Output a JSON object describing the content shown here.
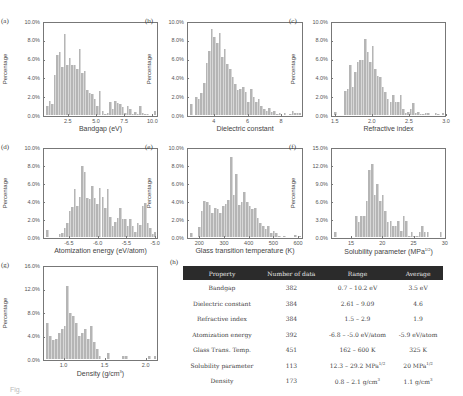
{
  "chart_data": [
    {
      "panel": "(a)",
      "type": "bar",
      "xlabel": "Bandgap (eV)",
      "ylabel": "Percentage",
      "ylim": [
        0,
        10
      ],
      "yticks": [
        "0.0%",
        "2.0%",
        "4.0%",
        "6.0%",
        "8.0%",
        "10.0%"
      ],
      "xlim": [
        0.3,
        10.5
      ],
      "xticks": [
        "2.5",
        "5.0",
        "7.5",
        "10.0"
      ],
      "xtick_values": [
        2.5,
        5.0,
        7.5,
        10.0
      ],
      "values": [
        1.0,
        1.5,
        1.2,
        4.4,
        6.5,
        6.9,
        5.2,
        8.8,
        5.4,
        6.2,
        5.4,
        5.4,
        5.0,
        7.2,
        4.6,
        4.8,
        2.7,
        2.4,
        2.3,
        1.7,
        1.0,
        2.6,
        0.4,
        0.1,
        0.2,
        1.4,
        0.6,
        1.5,
        1.3,
        1.2,
        0.9,
        0.2,
        1.0,
        0.6,
        0.1,
        0.3,
        0.1,
        1.0,
        0.2,
        0.1,
        0.1,
        0.0,
        0.0,
        0.4
      ]
    },
    {
      "panel": "(b)",
      "type": "bar",
      "xlabel": "Dielectric constant",
      "ylabel": "Percentage",
      "ylim": [
        0,
        10
      ],
      "yticks": [
        "0.0%",
        "2.0%",
        "4.0%",
        "6.0%",
        "8.0%",
        "10.0%"
      ],
      "xlim": [
        2.4,
        9.3
      ],
      "xticks": [
        "4",
        "6",
        "8"
      ],
      "xtick_values": [
        4,
        6,
        8
      ],
      "values": [
        1.2,
        0.0,
        2.0,
        1.7,
        2.4,
        3.5,
        5.6,
        7.0,
        9.3,
        8.5,
        7.8,
        8.9,
        6.3,
        7.2,
        5.5,
        5.0,
        4.1,
        3.4,
        2.7,
        2.8,
        3.0,
        2.5,
        1.4,
        2.8,
        2.0,
        1.4,
        1.7,
        1.0,
        0.7,
        0.4,
        0.8,
        0.3,
        0.4,
        0.1,
        0.2,
        0.0,
        0.2,
        0.0,
        0.1,
        0.4,
        0.2,
        0.2,
        0.2
      ]
    },
    {
      "panel": "(c)",
      "type": "bar",
      "xlabel": "Refractive index",
      "ylabel": "Percentage",
      "ylim": [
        0,
        10
      ],
      "yticks": [
        "0.0%",
        "2.0%",
        "4.0%",
        "6.0%",
        "8.0%",
        "10.0%"
      ],
      "xlim": [
        1.45,
        3.0
      ],
      "xticks": [
        "1.5",
        "2.0",
        "2.5",
        "3.0"
      ],
      "xtick_values": [
        1.5,
        2.0,
        2.5,
        3.0
      ],
      "values": [
        0.3,
        0.0,
        0.0,
        0.0,
        2.6,
        2.8,
        5.4,
        3.0,
        4.7,
        5.8,
        6.0,
        6.0,
        8.3,
        6.8,
        5.8,
        7.5,
        5.0,
        4.2,
        4.1,
        3.0,
        2.5,
        1.7,
        1.4,
        2.2,
        1.4,
        1.4,
        2.2,
        0.7,
        0.2,
        0.3,
        0.7,
        1.3,
        0.2,
        0.3,
        0.1,
        0.1,
        0.2,
        0.2,
        0.0,
        0.0,
        0.2,
        0.1,
        0.0,
        0.2
      ]
    },
    {
      "panel": "(d)",
      "type": "bar",
      "xlabel": "Atomization energy (eV/atom)",
      "ylabel": "Percentage",
      "ylim": [
        0,
        10
      ],
      "yticks": [
        "0.0%",
        "2.0%",
        "4.0%",
        "6.0%",
        "8.0%",
        "10.0%"
      ],
      "xlim": [
        -6.95,
        -4.95
      ],
      "xticks": [
        "-6.5",
        "-6.0",
        "-5.5",
        "-5.0"
      ],
      "xtick_values": [
        -6.5,
        -6.0,
        -5.5,
        -5.0
      ],
      "values": [
        0.8,
        0.0,
        0.0,
        0.0,
        0.0,
        0.3,
        0.4,
        1.0,
        1.6,
        3.0,
        3.4,
        5.5,
        3.5,
        4.5,
        8.1,
        7.4,
        4.4,
        4.3,
        5.8,
        4.4,
        3.8,
        5.6,
        4.6,
        3.3,
        5.4,
        2.3,
        1.3,
        1.7,
        2.2,
        3.3,
        2.0,
        2.0,
        1.3,
        2.0,
        1.2,
        0.6,
        1.6,
        1.4,
        3.5,
        3.9,
        1.6,
        1.0,
        0.3,
        0.6
      ]
    },
    {
      "panel": "(e)",
      "type": "bar",
      "xlabel": "Glass transition temperature (K)",
      "ylabel": "Percentage",
      "ylim": [
        0,
        10
      ],
      "yticks": [
        "0.0%",
        "2.0%",
        "4.0%",
        "6.0%",
        "8.0%",
        "10.0%"
      ],
      "xlim": [
        150,
        620
      ],
      "xticks": [
        "200",
        "300",
        "400",
        "500",
        "600"
      ],
      "xtick_values": [
        200,
        300,
        400,
        500,
        600
      ],
      "values": [
        0.5,
        0.0,
        0.0,
        1.1,
        3.0,
        4.1,
        4.0,
        3.6,
        2.7,
        3.3,
        3.2,
        2.7,
        3.5,
        3.8,
        4.2,
        9.1,
        4.8,
        7.2,
        3.6,
        4.0,
        5.1,
        4.0,
        3.5,
        3.2,
        3.3,
        2.2,
        1.6,
        1.2,
        0.9,
        1.3,
        0.4,
        0.7,
        0.5,
        0.1,
        0.0,
        0.1,
        0.0,
        0.0,
        0.0,
        0.2,
        0.0,
        0.1
      ]
    },
    {
      "panel": "(f)",
      "type": "bar",
      "xlabel": "Solubility parameter (MPa^1/2)",
      "ylabel": "Percentage",
      "ylim": [
        0,
        15
      ],
      "yticks": [
        "0.0%",
        "3.0%",
        "6.0%",
        "9.0%",
        "12.0%",
        "15.0%"
      ],
      "xlim": [
        11.8,
        30.2
      ],
      "xticks": [
        "15",
        "20",
        "25",
        "30"
      ],
      "xtick_values": [
        15,
        20,
        25,
        30
      ],
      "values": [
        0.9,
        0.0,
        0.0,
        0.0,
        0.0,
        0.0,
        0.0,
        0.0,
        3.5,
        2.5,
        3.5,
        3.5,
        6.2,
        11.5,
        12.4,
        7.1,
        9.1,
        6.2,
        7.1,
        4.4,
        2.6,
        2.7,
        1.8,
        1.8,
        2.7,
        1.0,
        3.5,
        2.7,
        0.1,
        0.9,
        0.1,
        0.1,
        0.9,
        1.8,
        0.9,
        0.9,
        0.0,
        0.0,
        0.0,
        0.0,
        0.9,
        0.0
      ]
    },
    {
      "panel": "(g)",
      "type": "bar",
      "xlabel": "Density (g/cm^3)",
      "ylabel": "Percentage",
      "ylim": [
        0,
        16
      ],
      "yticks": [
        "0.0%",
        "4.0%",
        "8.0%",
        "12.0%",
        "16.0%"
      ],
      "xlim": [
        0.75,
        2.15
      ],
      "xticks": [
        "1.0",
        "1.5",
        "2.0"
      ],
      "xtick_values": [
        1.0,
        1.5,
        2.0
      ],
      "values": [
        6.3,
        4.0,
        3.3,
        3.4,
        4.6,
        5.2,
        5.8,
        12.7,
        8.0,
        7.4,
        6.3,
        4.0,
        4.6,
        5.2,
        3.4,
        5.8,
        2.9,
        1.7,
        0.6,
        0.0,
        0.0,
        1.1,
        0.0,
        0.0,
        0.0,
        0.0,
        0.6,
        0.6,
        0.0,
        0.0,
        0.0,
        0.0,
        0.0,
        0.0,
        0.0,
        0.6,
        0.0,
        0.6
      ]
    }
  ],
  "panels": {
    "a": {
      "letter": "(a)",
      "xlabel": "Bandgap (eV)",
      "ylabel": "Percentage"
    },
    "b": {
      "letter": "(b)",
      "xlabel": "Dielectric constant",
      "ylabel": "Percentage"
    },
    "c": {
      "letter": "(c)",
      "xlabel": "Refractive index",
      "ylabel": "Percentage"
    },
    "d": {
      "letter": "(d)",
      "xlabel": "Atomization energy (eV/atom)",
      "ylabel": "Percentage"
    },
    "e": {
      "letter": "(e)",
      "xlabel": "Glass transition temperature (K)",
      "ylabel": "Percentage"
    },
    "f": {
      "letter": "(f)",
      "xlabel_main": "Solubility parameter (MPa",
      "xlabel_sup": "1/2",
      "xlabel_end": ")",
      "ylabel": "Percentage"
    },
    "g": {
      "letter": "(g)",
      "xlabel_main": "Density (g/cm",
      "xlabel_sup": "3",
      "xlabel_end": ")",
      "ylabel": "Percentage"
    },
    "h": {
      "letter": "(h)"
    }
  },
  "table": {
    "headers": [
      "Property",
      "Number of data",
      "Range",
      "Average"
    ],
    "rows": [
      {
        "property": "Bandgap",
        "count": "382",
        "range": "0.7 – 10.2 eV",
        "range_sup": "",
        "average": "3.5 eV",
        "average_sup": ""
      },
      {
        "property": "Dielectric constant",
        "count": "384",
        "range": "2.61 – 9.09",
        "range_sup": "",
        "average": "4.6",
        "average_sup": ""
      },
      {
        "property": "Refractive index",
        "count": "384",
        "range": "1.5 – 2.9",
        "range_sup": "",
        "average": "1.9",
        "average_sup": ""
      },
      {
        "property": "Atomization energy",
        "count": "392",
        "range": "-6.8 – -5.0 eV/atom",
        "range_sup": "",
        "average": "-5.9 eV/atom",
        "average_sup": ""
      },
      {
        "property": "Glass Trans. Temp.",
        "count": "451",
        "range": "162 – 600 K",
        "range_sup": "",
        "average": "325 K",
        "average_sup": ""
      },
      {
        "property": "Solubility parameter",
        "count": "113",
        "range": "12.3 – 29.2 MPa",
        "range_sup": "1/2",
        "average": "20 MPa",
        "average_sup": "1/2"
      },
      {
        "property": "Density",
        "count": "173",
        "range": "0.8 – 2.1 g/cm",
        "range_sup": "3",
        "average": "1.1 g/cm",
        "average_sup": "3"
      }
    ]
  },
  "caption_fragment": "Fig."
}
